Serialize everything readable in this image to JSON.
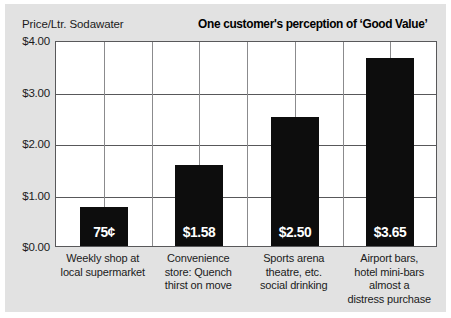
{
  "chart_data": {
    "type": "bar",
    "title": "One customer's perception of ‘Good Value’",
    "ylabel": "Price/Ltr. Sodawater",
    "xlabel": "",
    "ylim": [
      0,
      4.0
    ],
    "ytick_labels": [
      "$4.00",
      "$3.00",
      "$2.00",
      "$1.00",
      "$0.00"
    ],
    "ytick_values": [
      4.0,
      3.0,
      2.0,
      1.0,
      0.0
    ],
    "grid": "both",
    "legend": "none",
    "bar_color": "#0d0d0d",
    "categories": [
      "Weekly shop at local supermarket",
      "Convenience store: Quench thirst on move",
      "Sports arena theatre, etc. social drinking",
      "Airport bars, hotel mini-bars almost a distress purchase"
    ],
    "category_lines": [
      [
        "Weekly shop at",
        "local supermarket"
      ],
      [
        "Convenience",
        "store: Quench",
        "thirst on move"
      ],
      [
        "Sports arena",
        "theatre, etc.",
        "social drinking"
      ],
      [
        "Airport bars,",
        "hotel mini-bars",
        "almost a",
        "distress purchase"
      ]
    ],
    "values": [
      0.75,
      1.58,
      2.5,
      3.65
    ],
    "value_labels": [
      "75¢",
      "$1.58",
      "$2.50",
      "$3.65"
    ]
  },
  "colors": {
    "background": "#e2e2e2",
    "plot_background": "#ffffff",
    "bar": "#0d0d0d",
    "grid_major": "#58585a",
    "grid_minor": "#8b8b8d",
    "text": "#1b1b1b",
    "value_text": "#ffffff"
  }
}
